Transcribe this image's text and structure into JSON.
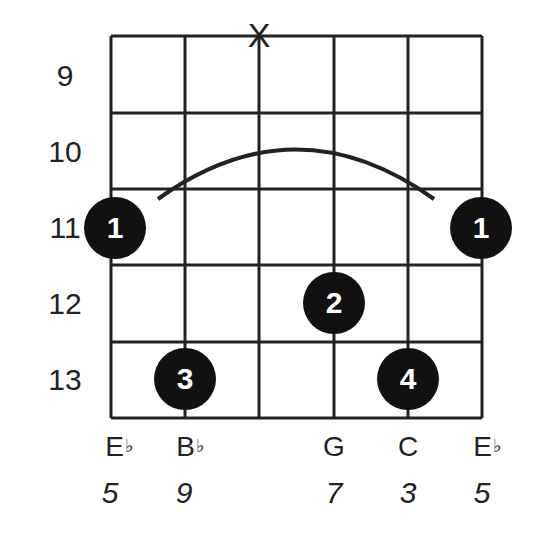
{
  "diagram": {
    "type": "guitar-chord-diagram",
    "strings": 6,
    "frets_shown": [
      9,
      10,
      11,
      12,
      13
    ],
    "fret_labels": [
      "9",
      "10",
      "11",
      "12",
      "13"
    ],
    "muted_marker": "X",
    "muted_string_index": 3,
    "barre": {
      "fret": 11,
      "finger": "1",
      "from_string": 1,
      "to_string": 6
    },
    "fingers": [
      {
        "label": "1",
        "string": 1,
        "fret": 11
      },
      {
        "label": "1",
        "string": 6,
        "fret": 11
      },
      {
        "label": "2",
        "string": 4,
        "fret": 12
      },
      {
        "label": "3",
        "string": 2,
        "fret": 13
      },
      {
        "label": "4",
        "string": 5,
        "fret": 13
      }
    ],
    "notes": [
      {
        "string": 1,
        "letter": "E",
        "accidental": "♭",
        "degree": "5"
      },
      {
        "string": 2,
        "letter": "B",
        "accidental": "♭",
        "degree": "9"
      },
      {
        "string": 3,
        "letter": "",
        "accidental": "",
        "degree": ""
      },
      {
        "string": 4,
        "letter": "G",
        "accidental": "",
        "degree": "7"
      },
      {
        "string": 5,
        "letter": "C",
        "accidental": "",
        "degree": "3"
      },
      {
        "string": 6,
        "letter": "E",
        "accidental": "♭",
        "degree": "5"
      }
    ],
    "colors": {
      "line": "#222222",
      "dot": "#111111",
      "dot_text": "#ffffff",
      "background": "#ffffff"
    }
  }
}
